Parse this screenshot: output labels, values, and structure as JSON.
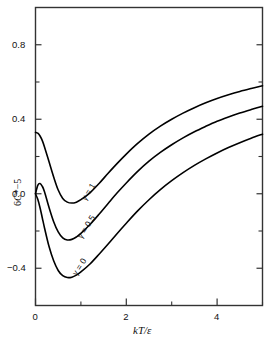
{
  "chart_data": {
    "type": "line",
    "title": "",
    "xlabel": "kT/ε",
    "ylabel": "6C*−5",
    "xlim": [
      0,
      5
    ],
    "ylim": [
      -0.6,
      1.0
    ],
    "grid": false,
    "legend_position": "inline-curve-labels",
    "x_ticks_major": [
      "0",
      "2",
      "4"
    ],
    "x_tick_values_major": [
      0,
      2,
      4
    ],
    "x_tick_values_minor": [
      1,
      3,
      5
    ],
    "y_ticks_major": [
      "0.8",
      "0.4",
      "0.0",
      "−0.4"
    ],
    "y_tick_values_major": [
      0.8,
      0.4,
      0.0,
      -0.4
    ],
    "y_tick_values_minor": [
      0.6,
      0.2,
      -0.2
    ],
    "series": [
      {
        "name": "γ = 1",
        "label": "γ = 1",
        "x": [
          0.0,
          0.05,
          0.1,
          0.15,
          0.2,
          0.3,
          0.4,
          0.5,
          0.6,
          0.7,
          0.8,
          0.9,
          1.0,
          1.2,
          1.4,
          1.6,
          1.8,
          2.0,
          2.25,
          2.5,
          2.75,
          3.0,
          3.25,
          3.5,
          3.75,
          4.0,
          4.25,
          4.5,
          4.75,
          5.0
        ],
        "y": [
          0.33,
          0.325,
          0.31,
          0.285,
          0.25,
          0.17,
          0.09,
          0.02,
          -0.025,
          -0.045,
          -0.05,
          -0.045,
          -0.032,
          0.005,
          0.055,
          0.11,
          0.163,
          0.213,
          0.27,
          0.32,
          0.363,
          0.4,
          0.433,
          0.462,
          0.488,
          0.511,
          0.531,
          0.549,
          0.565,
          0.58
        ]
      },
      {
        "name": "γ = 0.5",
        "label": "γ = 0.5",
        "x": [
          0.0,
          0.05,
          0.1,
          0.15,
          0.2,
          0.3,
          0.4,
          0.5,
          0.6,
          0.7,
          0.8,
          0.9,
          1.0,
          1.2,
          1.4,
          1.6,
          1.8,
          2.0,
          2.25,
          2.5,
          2.75,
          3.0,
          3.25,
          3.5,
          3.75,
          4.0,
          4.25,
          4.5,
          4.75,
          5.0
        ],
        "y": [
          0.0,
          0.045,
          0.055,
          0.04,
          0.01,
          -0.075,
          -0.15,
          -0.205,
          -0.237,
          -0.248,
          -0.245,
          -0.232,
          -0.213,
          -0.165,
          -0.11,
          -0.052,
          0.005,
          0.058,
          0.12,
          0.175,
          0.222,
          0.263,
          0.3,
          0.333,
          0.362,
          0.389,
          0.412,
          0.433,
          0.452,
          0.47
        ]
      },
      {
        "name": "γ = 0",
        "label": "γ = 0",
        "x": [
          0.0,
          0.05,
          0.1,
          0.15,
          0.2,
          0.3,
          0.4,
          0.5,
          0.6,
          0.7,
          0.8,
          0.9,
          1.0,
          1.2,
          1.4,
          1.6,
          1.8,
          2.0,
          2.25,
          2.5,
          2.75,
          3.0,
          3.25,
          3.5,
          3.75,
          4.0,
          4.25,
          4.5,
          4.75,
          5.0
        ],
        "y": [
          0.0,
          -0.03,
          -0.075,
          -0.13,
          -0.185,
          -0.285,
          -0.36,
          -0.412,
          -0.44,
          -0.45,
          -0.448,
          -0.437,
          -0.42,
          -0.377,
          -0.325,
          -0.27,
          -0.213,
          -0.158,
          -0.092,
          -0.032,
          0.022,
          0.07,
          0.113,
          0.152,
          0.187,
          0.219,
          0.248,
          0.274,
          0.298,
          0.32
        ]
      }
    ],
    "curve_labels": [
      {
        "text": "γ = 1",
        "x": 0.96,
        "y": -0.02,
        "rotation": -58
      },
      {
        "text": "γ = 0.5",
        "x": 0.86,
        "y": -0.22,
        "rotation": -58
      },
      {
        "text": "γ = 0",
        "x": 0.75,
        "y": -0.42,
        "rotation": -58
      }
    ],
    "style": {
      "line_color": "#000000",
      "axis_color": "#333333",
      "background": "#ffffff",
      "line_width": 1.6
    }
  }
}
